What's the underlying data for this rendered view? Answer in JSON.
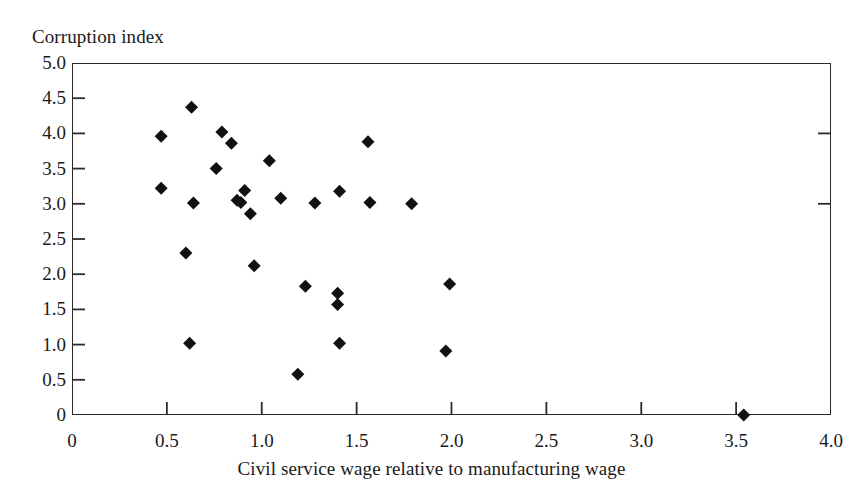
{
  "chart_data": {
    "type": "scatter",
    "title": "",
    "subtitle": "",
    "xlabel": "Civil service wage relative to manufacturing wage",
    "ylabel": "Corruption index",
    "xlim": [
      0,
      4.0
    ],
    "ylim": [
      0,
      5.0
    ],
    "grid": false,
    "legend": null,
    "marker": {
      "shape": "diamond",
      "color": "#111111",
      "size_px": 13
    },
    "axis": {
      "line_color": "#2b2b2b",
      "tick_side": "inside-left-and-right",
      "x_ticks": [
        0,
        0.5,
        1.0,
        1.5,
        2.0,
        2.5,
        3.0,
        3.5,
        4.0
      ],
      "x_tick_labels": [
        "0",
        "0.5",
        "1.0",
        "1.5",
        "2.0",
        "2.5",
        "3.0",
        "3.5",
        "4.0"
      ],
      "y_ticks": [
        0,
        0.5,
        1.0,
        1.5,
        2.0,
        2.5,
        3.0,
        3.5,
        4.0,
        4.5,
        5.0
      ],
      "y_tick_labels": [
        "0",
        "0.5",
        "1.0",
        "1.5",
        "2.0",
        "2.5",
        "3.0",
        "3.5",
        "4.0",
        "4.5",
        "5.0"
      ],
      "y_right_ticks": [
        3.0,
        4.0
      ]
    },
    "points": [
      {
        "x": 0.47,
        "y": 3.96
      },
      {
        "x": 0.47,
        "y": 3.22
      },
      {
        "x": 0.6,
        "y": 2.3
      },
      {
        "x": 0.62,
        "y": 1.02
      },
      {
        "x": 0.63,
        "y": 4.37
      },
      {
        "x": 0.64,
        "y": 3.01
      },
      {
        "x": 0.76,
        "y": 3.5
      },
      {
        "x": 0.79,
        "y": 4.02
      },
      {
        "x": 0.84,
        "y": 3.86
      },
      {
        "x": 0.87,
        "y": 3.05
      },
      {
        "x": 0.89,
        "y": 3.02
      },
      {
        "x": 0.91,
        "y": 3.19
      },
      {
        "x": 0.94,
        "y": 2.86
      },
      {
        "x": 0.96,
        "y": 2.12
      },
      {
        "x": 1.04,
        "y": 3.61
      },
      {
        "x": 1.1,
        "y": 3.08
      },
      {
        "x": 1.19,
        "y": 0.58
      },
      {
        "x": 1.23,
        "y": 1.83
      },
      {
        "x": 1.28,
        "y": 3.01
      },
      {
        "x": 1.4,
        "y": 1.73
      },
      {
        "x": 1.4,
        "y": 1.57
      },
      {
        "x": 1.41,
        "y": 1.02
      },
      {
        "x": 1.41,
        "y": 3.18
      },
      {
        "x": 1.56,
        "y": 3.88
      },
      {
        "x": 1.57,
        "y": 3.02
      },
      {
        "x": 1.79,
        "y": 3.0
      },
      {
        "x": 1.97,
        "y": 0.91
      },
      {
        "x": 1.99,
        "y": 1.86
      },
      {
        "x": 3.54,
        "y": 0.0
      }
    ]
  }
}
